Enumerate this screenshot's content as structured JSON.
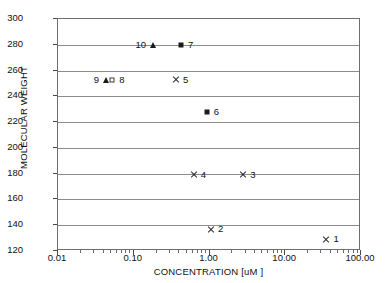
{
  "chart_data": {
    "type": "scatter",
    "title": "",
    "xlabel": "CONCENTRATION [uM ]",
    "ylabel": "MOLECULAR WEIGHT",
    "xscale": "log",
    "xlim": [
      0.01,
      100
    ],
    "ylim": [
      120,
      300
    ],
    "grid": "horizontal",
    "legend": "none",
    "x_tick_labels": [
      "0.01",
      "0.10",
      "1.00",
      "10.00",
      "100.00"
    ],
    "x_tick_values": [
      0.01,
      0.1,
      1,
      10,
      100
    ],
    "y_tick_labels": [
      "120",
      "140",
      "160",
      "180",
      "200",
      "220",
      "240",
      "260",
      "280",
      "300"
    ],
    "y_tick_values": [
      120,
      140,
      160,
      180,
      200,
      220,
      240,
      260,
      280,
      300
    ],
    "points": [
      {
        "id": "1",
        "x": 35.0,
        "y": 129,
        "marker": "cross",
        "label": "1",
        "label_side": "right"
      },
      {
        "id": "2",
        "x": 1.05,
        "y": 137,
        "marker": "cross",
        "label": "2",
        "label_side": "right"
      },
      {
        "id": "3",
        "x": 2.8,
        "y": 179,
        "marker": "cross",
        "label": "3",
        "label_side": "right"
      },
      {
        "id": "4",
        "x": 0.62,
        "y": 179,
        "marker": "cross",
        "label": "4",
        "label_side": "right"
      },
      {
        "id": "5",
        "x": 0.36,
        "y": 253,
        "marker": "cross",
        "label": "5",
        "label_side": "right"
      },
      {
        "id": "6",
        "x": 0.92,
        "y": 228,
        "marker": "square",
        "label": "6",
        "label_side": "right"
      },
      {
        "id": "7",
        "x": 0.42,
        "y": 280,
        "marker": "square",
        "label": "7",
        "label_side": "right"
      },
      {
        "id": "8",
        "x": 0.052,
        "y": 253,
        "marker": "square-open",
        "label": "8",
        "label_side": "right"
      },
      {
        "id": "9",
        "x": 0.043,
        "y": 253,
        "marker": "triangle",
        "label": "9",
        "label_side": "left"
      },
      {
        "id": "10",
        "x": 0.18,
        "y": 280,
        "marker": "triangle",
        "label": "10",
        "label_side": "left"
      }
    ]
  },
  "colors": {
    "frame": "#6e6e6e",
    "gridline": "#8c8c8c",
    "marker": "#1a1a1a",
    "text": "#111111",
    "background": "#ffffff"
  }
}
